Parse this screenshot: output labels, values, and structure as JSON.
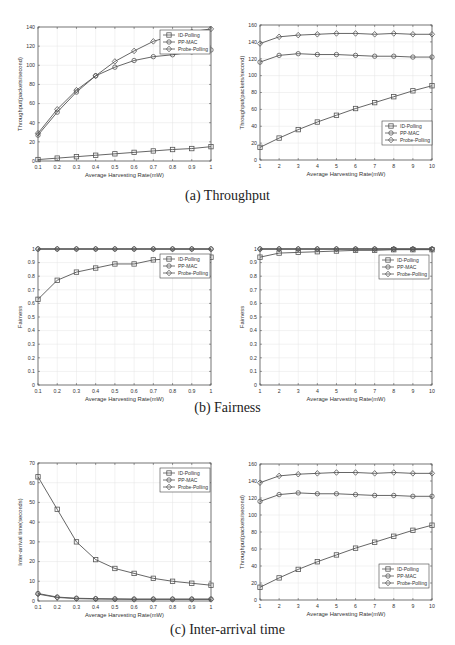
{
  "captions": {
    "a": "(a) Throughput",
    "b": "(b) Fairness",
    "c": "(c) Inter-arrival time"
  },
  "legend": [
    "ID-Polling",
    "PP-MAC",
    "Probe-Polling"
  ],
  "chart_data": [
    {
      "id": "a-left",
      "type": "line",
      "title": "",
      "xlabel": "Average Harvesting Rate(mW)",
      "ylabel": "Throughput(packets/second)",
      "x": [
        0.1,
        0.2,
        0.3,
        0.4,
        0.5,
        0.6,
        0.7,
        0.8,
        0.9,
        1.0
      ],
      "xticks": [
        "0.1",
        "0.2",
        "0.3",
        "0.4",
        "0.5",
        "0.6",
        "0.7",
        "0.8",
        "0.9",
        "1"
      ],
      "ylim": [
        0,
        140
      ],
      "yticks": [
        0,
        20,
        40,
        60,
        80,
        100,
        120,
        140
      ],
      "grid": true,
      "legend_position": "upper right",
      "series": [
        {
          "name": "ID-Polling",
          "marker": "square",
          "values": [
            1.5,
            3,
            4.5,
            6,
            7.5,
            9,
            10.5,
            12,
            13,
            15
          ]
        },
        {
          "name": "PP-MAC",
          "marker": "circle",
          "values": [
            27,
            51,
            72,
            89,
            98,
            105,
            109,
            111,
            114,
            116
          ]
        },
        {
          "name": "Probe-Polling",
          "marker": "diamond",
          "values": [
            29,
            54,
            74,
            89,
            104,
            115,
            125,
            131,
            135,
            138
          ]
        }
      ]
    },
    {
      "id": "a-right",
      "type": "line",
      "title": "",
      "xlabel": "Average Harvesting Rate(mW)",
      "ylabel": "Throughput(packets/second)",
      "x": [
        1,
        2,
        3,
        4,
        5,
        6,
        7,
        8,
        9,
        10
      ],
      "xticks": [
        "1",
        "2",
        "3",
        "4",
        "5",
        "6",
        "7",
        "8",
        "9",
        "10"
      ],
      "ylim": [
        0,
        160
      ],
      "yticks": [
        0,
        20,
        40,
        60,
        80,
        100,
        120,
        140,
        160
      ],
      "grid": true,
      "legend_position": "lower right",
      "series": [
        {
          "name": "ID-Polling",
          "marker": "square",
          "values": [
            15,
            26,
            36,
            45,
            53,
            61,
            68,
            75,
            82,
            88
          ]
        },
        {
          "name": "PP-MAC",
          "marker": "circle",
          "values": [
            116,
            124,
            126,
            125,
            125,
            124,
            123,
            123,
            122,
            122
          ]
        },
        {
          "name": "Probe-Polling",
          "marker": "diamond",
          "values": [
            138,
            146,
            148,
            149,
            150,
            150,
            149,
            150,
            149,
            149
          ]
        }
      ]
    },
    {
      "id": "b-left",
      "type": "line",
      "title": "",
      "xlabel": "Average Harvesting Rate(mW)",
      "ylabel": "Fairness",
      "x": [
        0.1,
        0.2,
        0.3,
        0.4,
        0.5,
        0.6,
        0.7,
        0.8,
        0.9,
        1.0
      ],
      "xticks": [
        "0.1",
        "0.2",
        "0.3",
        "0.4",
        "0.5",
        "0.6",
        "0.7",
        "0.8",
        "0.9",
        "1"
      ],
      "ylim": [
        0,
        1
      ],
      "yticks": [
        0,
        0.1,
        0.2,
        0.3,
        0.4,
        0.5,
        0.6,
        0.7,
        0.8,
        0.9,
        1
      ],
      "grid": true,
      "legend_position": "upper right",
      "series": [
        {
          "name": "ID-Polling",
          "marker": "square",
          "values": [
            0.63,
            0.77,
            0.83,
            0.86,
            0.89,
            0.89,
            0.92,
            0.93,
            0.93,
            0.94
          ]
        },
        {
          "name": "PP-MAC",
          "marker": "circle",
          "values": [
            1,
            1,
            1,
            1,
            1,
            1,
            1,
            1,
            1,
            1
          ]
        },
        {
          "name": "Probe-Polling",
          "marker": "diamond",
          "values": [
            1,
            1,
            1,
            1,
            1,
            1,
            1,
            1,
            1,
            1
          ]
        }
      ]
    },
    {
      "id": "b-right",
      "type": "line",
      "title": "",
      "xlabel": "Average Harvesting Rate(mW)",
      "ylabel": "Fairness",
      "x": [
        1,
        2,
        3,
        4,
        5,
        6,
        7,
        8,
        9,
        10
      ],
      "xticks": [
        "1",
        "2",
        "3",
        "4",
        "5",
        "6",
        "7",
        "8",
        "9",
        "10"
      ],
      "ylim": [
        0,
        1
      ],
      "yticks": [
        0,
        0.1,
        0.2,
        0.3,
        0.4,
        0.5,
        0.6,
        0.7,
        0.8,
        0.9,
        1
      ],
      "grid": true,
      "legend_position": "upper right",
      "series": [
        {
          "name": "ID-Polling",
          "marker": "square",
          "values": [
            0.94,
            0.97,
            0.975,
            0.98,
            0.985,
            0.99,
            0.99,
            0.995,
            0.995,
            0.995
          ]
        },
        {
          "name": "PP-MAC",
          "marker": "circle",
          "values": [
            1,
            1,
            1,
            1,
            1,
            1,
            1,
            1,
            1,
            1
          ]
        },
        {
          "name": "Probe-Polling",
          "marker": "diamond",
          "values": [
            1,
            1,
            1,
            1,
            1,
            1,
            1,
            1,
            1,
            1
          ]
        }
      ]
    },
    {
      "id": "c-left",
      "type": "line",
      "title": "",
      "xlabel": "Average Harvesting Rate(mW)",
      "ylabel": "Inter-arrival time(seconds)",
      "x": [
        0.1,
        0.2,
        0.3,
        0.4,
        0.5,
        0.6,
        0.7,
        0.8,
        0.9,
        1.0
      ],
      "xticks": [
        "0.1",
        "0.2",
        "0.3",
        "0.4",
        "0.5",
        "0.6",
        "0.7",
        "0.8",
        "0.9",
        "1"
      ],
      "ylim": [
        0,
        70
      ],
      "yticks": [
        0,
        10,
        20,
        30,
        40,
        50,
        60,
        70
      ],
      "grid": true,
      "legend_position": "upper right",
      "series": [
        {
          "name": "ID-Polling",
          "marker": "square",
          "values": [
            63,
            46.5,
            30,
            21,
            16.5,
            14,
            11.5,
            10,
            9,
            8
          ]
        },
        {
          "name": "PP-MAC",
          "marker": "circle",
          "values": [
            3.8,
            2,
            1.4,
            1.2,
            1.1,
            1,
            1,
            1,
            1,
            1
          ]
        },
        {
          "name": "Probe-Polling",
          "marker": "diamond",
          "values": [
            3.5,
            1.8,
            1.2,
            1,
            0.9,
            0.8,
            0.8,
            0.8,
            0.8,
            0.8
          ]
        }
      ]
    },
    {
      "id": "c-right",
      "type": "line",
      "title": "",
      "xlabel": "Average Harvesting Rate(mW)",
      "ylabel": "Throughput(packets/second)",
      "x": [
        1,
        2,
        3,
        4,
        5,
        6,
        7,
        8,
        9,
        10
      ],
      "xticks": [
        "1",
        "2",
        "3",
        "4",
        "5",
        "6",
        "7",
        "8",
        "9",
        "10"
      ],
      "ylim": [
        0,
        160
      ],
      "yticks": [
        0,
        20,
        40,
        60,
        80,
        100,
        120,
        140,
        160
      ],
      "grid": true,
      "legend_position": "lower right",
      "series": [
        {
          "name": "ID-Polling",
          "marker": "square",
          "values": [
            15,
            26,
            36,
            45,
            53,
            61,
            68,
            75,
            82,
            88
          ]
        },
        {
          "name": "PP-MAC",
          "marker": "circle",
          "values": [
            116,
            124,
            126,
            125,
            125,
            124,
            123,
            123,
            122,
            122
          ]
        },
        {
          "name": "Probe-Polling",
          "marker": "diamond",
          "values": [
            138,
            146,
            148,
            149,
            150,
            150,
            149,
            150,
            149,
            149
          ]
        }
      ]
    }
  ],
  "layout": [
    {
      "left": 0,
      "top": 0,
      "plot": [
        38,
        27,
        211,
        161
      ],
      "legend": [
        160,
        30,
        50,
        24
      ]
    },
    {
      "left": 0,
      "top": 0,
      "plot": [
        260,
        25,
        432,
        160
      ],
      "legend": [
        382,
        121,
        50,
        24
      ]
    },
    {
      "left": 0,
      "top": 0,
      "plot": [
        38,
        249,
        211,
        385
      ],
      "legend": [
        160,
        254,
        50,
        24
      ]
    },
    {
      "left": 0,
      "top": 0,
      "plot": [
        260,
        249,
        432,
        385
      ],
      "legend": [
        379,
        255,
        50,
        24
      ]
    },
    {
      "left": 0,
      "top": 0,
      "plot": [
        38,
        463,
        211,
        601
      ],
      "legend": [
        160,
        468,
        50,
        24
      ]
    },
    {
      "left": 0,
      "top": 0,
      "plot": [
        260,
        464,
        432,
        600
      ],
      "legend": [
        379,
        564,
        50,
        24
      ]
    }
  ]
}
